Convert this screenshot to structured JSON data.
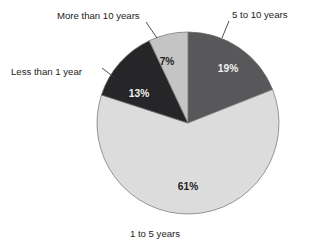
{
  "chart_data": {
    "type": "pie",
    "title": "",
    "subtitle": "",
    "xlabel": "",
    "ylabel": "",
    "legend_position": "none",
    "grid": false,
    "start_angle_deg": 0,
    "direction": "clockwise",
    "total_percent": 100,
    "categories": [
      "5 to 10 years",
      "1 to 5 years",
      "Less than 1 year",
      "More than 10 years"
    ],
    "values": [
      19,
      61,
      13,
      7
    ],
    "value_labels": [
      "19%",
      "61%",
      "13%",
      "7%"
    ],
    "colors": [
      "#58585a",
      "#dcdcdc",
      "#262628",
      "#c4c4c4"
    ],
    "slices": [
      {
        "label": "5 to 10 years",
        "value": 19,
        "value_label": "19%",
        "color": "#58585a",
        "start_deg": 0,
        "end_deg": 68.4,
        "label_text_color": "#f2f2f2",
        "external_label_position": "top-right"
      },
      {
        "label": "1 to 5 years",
        "value": 61,
        "value_label": "61%",
        "color": "#dcdcdc",
        "start_deg": 68.4,
        "end_deg": 288.0,
        "label_text_color": "#1d1d1d",
        "external_label_position": "bottom"
      },
      {
        "label": "Less than 1 year",
        "value": 13,
        "value_label": "13%",
        "color": "#262628",
        "start_deg": 288.0,
        "end_deg": 334.8,
        "label_text_color": "#f2f2f2",
        "external_label_position": "left"
      },
      {
        "label": "More than 10 years",
        "value": 7,
        "value_label": "7%",
        "color": "#c4c4c4",
        "start_deg": 334.8,
        "end_deg": 360.0,
        "label_text_color": "#1d1d1d",
        "external_label_position": "top-left"
      }
    ]
  },
  "labels": {
    "more_than_10": "More than 10 years",
    "five_to_ten": "5 to 10 years",
    "less_than_1": "Less than 1 year",
    "one_to_five": "1 to 5 years",
    "pct_19": "19%",
    "pct_61": "61%",
    "pct_13": "13%",
    "pct_7": "7%"
  }
}
